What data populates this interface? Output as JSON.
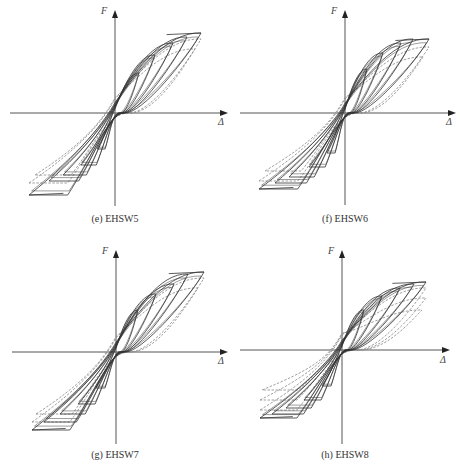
{
  "chart_data": [
    {
      "type": "line",
      "id": "e",
      "title": "(e) EHSW5",
      "xlabel": "Δ",
      "ylabel": "F",
      "grid": false,
      "origin": [
        115,
        113
      ],
      "axes": {
        "x_from": 10,
        "x_to": 228,
        "y_from": 10,
        "y_to": 206
      },
      "loops_solid": [
        {
          "pos": [
            24,
            -40
          ],
          "neg": [
            -18,
            36
          ],
          "pinch": 14
        },
        {
          "pos": [
            40,
            -58
          ],
          "neg": [
            -34,
            52
          ],
          "pinch": 18
        },
        {
          "pos": [
            58,
            -70
          ],
          "neg": [
            -52,
            62
          ],
          "pinch": 22
        },
        {
          "pos": [
            72,
            -76
          ],
          "neg": [
            -66,
            68
          ],
          "pinch": 26
        },
        {
          "pos": [
            86,
            -80
          ],
          "neg": [
            -86,
            82
          ],
          "pinch": 30
        }
      ],
      "loops_dashed": [
        {
          "pos": [
            86,
            -74
          ],
          "neg": [
            -86,
            70
          ],
          "pinch": 40
        },
        {
          "pos": [
            80,
            -64
          ],
          "neg": [
            -80,
            62
          ],
          "pinch": 44
        }
      ],
      "peak_pos": [
        86,
        -80
      ],
      "peak_neg": [
        -86,
        82
      ]
    },
    {
      "type": "line",
      "id": "f",
      "title": "(f) EHSW6",
      "xlabel": "Δ",
      "ylabel": "F",
      "grid": false,
      "origin": [
        115,
        113
      ],
      "axes": {
        "x_from": 10,
        "x_to": 226,
        "y_from": 10,
        "y_to": 205
      },
      "loops_solid": [
        {
          "pos": [
            22,
            -44
          ],
          "neg": [
            -18,
            40
          ],
          "pinch": 12
        },
        {
          "pos": [
            38,
            -60
          ],
          "neg": [
            -36,
            54
          ],
          "pinch": 16
        },
        {
          "pos": [
            56,
            -70
          ],
          "neg": [
            -56,
            64
          ],
          "pinch": 20
        },
        {
          "pos": [
            68,
            -74
          ],
          "neg": [
            -70,
            70
          ],
          "pinch": 24
        },
        {
          "pos": [
            84,
            -74
          ],
          "neg": [
            -86,
            76
          ],
          "pinch": 28
        }
      ],
      "loops_dashed": [
        {
          "pos": [
            84,
            -66
          ],
          "neg": [
            -86,
            68
          ],
          "pinch": 40
        },
        {
          "pos": [
            78,
            -56
          ],
          "neg": [
            -80,
            58
          ],
          "pinch": 44
        }
      ],
      "peak_pos": [
        84,
        -74
      ],
      "peak_neg": [
        -86,
        76
      ]
    },
    {
      "type": "line",
      "id": "g",
      "title": "(g) EHSW7",
      "xlabel": "Δ",
      "ylabel": "F",
      "grid": false,
      "origin": [
        116,
        116
      ],
      "axes": {
        "x_from": 12,
        "x_to": 228,
        "y_from": 14,
        "y_to": 208
      },
      "loops_solid": [
        {
          "pos": [
            22,
            -42
          ],
          "neg": [
            -20,
            36
          ],
          "pinch": 12
        },
        {
          "pos": [
            40,
            -58
          ],
          "neg": [
            -38,
            52
          ],
          "pinch": 16
        },
        {
          "pos": [
            58,
            -68
          ],
          "neg": [
            -56,
            62
          ],
          "pinch": 20
        },
        {
          "pos": [
            72,
            -78
          ],
          "neg": [
            -72,
            70
          ],
          "pinch": 24
        },
        {
          "pos": [
            88,
            -80
          ],
          "neg": [
            -84,
            78
          ],
          "pinch": 28
        }
      ],
      "loops_dashed": [
        {
          "pos": [
            88,
            -74
          ],
          "neg": [
            -84,
            70
          ],
          "pinch": 40
        },
        {
          "pos": [
            82,
            -64
          ],
          "neg": [
            -80,
            62
          ],
          "pinch": 44
        }
      ],
      "peak_pos": [
        88,
        -80
      ],
      "peak_neg": [
        -84,
        78
      ]
    },
    {
      "type": "line",
      "id": "h",
      "title": "(h) EHSW8",
      "xlabel": "Δ",
      "ylabel": "F",
      "grid": false,
      "origin": [
        112,
        114
      ],
      "axes": {
        "x_from": 10,
        "x_to": 220,
        "y_from": 14,
        "y_to": 208
      },
      "loops_solid": [
        {
          "pos": [
            22,
            -40
          ],
          "neg": [
            -20,
            36
          ],
          "pinch": 12
        },
        {
          "pos": [
            40,
            -54
          ],
          "neg": [
            -38,
            50
          ],
          "pinch": 16
        },
        {
          "pos": [
            58,
            -62
          ],
          "neg": [
            -56,
            58
          ],
          "pinch": 20
        },
        {
          "pos": [
            72,
            -66
          ],
          "neg": [
            -70,
            64
          ],
          "pinch": 24
        },
        {
          "pos": [
            84,
            -68
          ],
          "neg": [
            -82,
            68
          ],
          "pinch": 28
        }
      ],
      "loops_dashed": [
        {
          "pos": [
            84,
            -62
          ],
          "neg": [
            -82,
            60
          ],
          "pinch": 42
        },
        {
          "pos": [
            84,
            -52
          ],
          "neg": [
            -82,
            50
          ],
          "pinch": 46
        },
        {
          "pos": [
            80,
            -40
          ],
          "neg": [
            -80,
            40
          ],
          "pinch": 48
        }
      ],
      "peak_pos": [
        84,
        -68
      ],
      "peak_neg": [
        -82,
        68
      ]
    }
  ],
  "style": {
    "axis_color": "#555555",
    "solid_color": "#333333",
    "dashed_color": "#888888"
  }
}
